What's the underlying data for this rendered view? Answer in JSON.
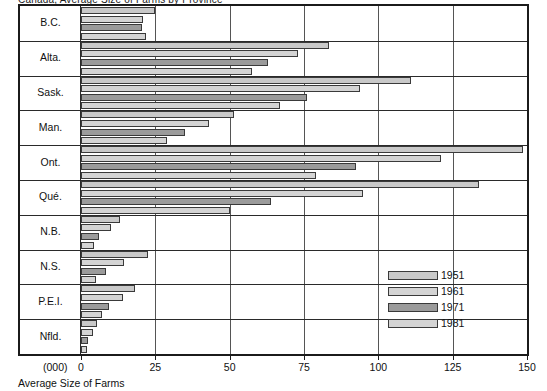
{
  "title_clipped": "Canada, Average Size of Farms by Province",
  "caption": "Average Size of Farms",
  "unit_label": "(000)",
  "legend": {
    "items": [
      {
        "label": "1951",
        "tone": "mid"
      },
      {
        "label": "1961",
        "tone": "light"
      },
      {
        "label": "1971",
        "tone": "dark"
      },
      {
        "label": "1981",
        "tone": "light"
      }
    ]
  },
  "colors": {
    "bar_1951": "#c9c9c9",
    "bar_1961": "#d4d4d4",
    "bar_1971": "#9b9b9b",
    "bar_1981": "#d4d4d4",
    "frame": "#1b1b1b",
    "grid": "#555555"
  },
  "chart_data": {
    "type": "bar",
    "orientation": "horizontal",
    "title": "Average Size of Farms",
    "xlabel": "(000)",
    "ylabel": "",
    "xlim": [
      0,
      150
    ],
    "xticks": [
      0,
      25,
      50,
      75,
      100,
      125,
      150
    ],
    "xticklabels": [
      "0",
      "25",
      "50",
      "75",
      "100",
      "125",
      "150"
    ],
    "grid": true,
    "legend_position": "inside-right",
    "categories": [
      "B.C.",
      "Alta.",
      "Sask.",
      "Man.",
      "Ont.",
      "Qué.",
      "N.B.",
      "N.S.",
      "P.E.I.",
      "Nfld."
    ],
    "series": [
      {
        "name": "1951",
        "values": [
          25,
          83.5,
          111,
          51.5,
          148.5,
          134,
          13,
          22.5,
          18,
          5.5
        ]
      },
      {
        "name": "1961",
        "values": [
          21,
          73,
          94,
          43,
          121,
          95,
          10,
          14.5,
          14,
          4
        ]
      },
      {
        "name": "1971",
        "values": [
          20.5,
          63,
          76,
          35,
          92.5,
          64,
          6,
          8.5,
          9.5,
          2.5
        ]
      },
      {
        "name": "1981",
        "values": [
          22,
          57.5,
          67,
          29,
          79,
          50,
          4.5,
          5,
          7,
          2
        ]
      }
    ]
  }
}
